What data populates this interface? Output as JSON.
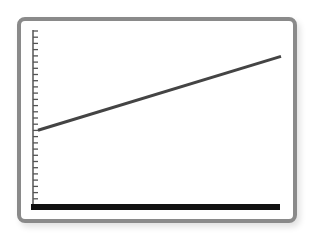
{
  "chart_data": {
    "type": "line",
    "title": "",
    "xlabel": "",
    "ylabel": "",
    "grid": false,
    "legend": null,
    "y_tick_count": 29,
    "series": [
      {
        "name": "line",
        "x": [
          0,
          1
        ],
        "values": [
          0.43,
          0.85
        ],
        "color": "#444444"
      }
    ],
    "xlim": [
      0,
      1
    ],
    "ylim": [
      0,
      1
    ]
  },
  "colors": {
    "frame_border": "#8a8a8a",
    "axis": "#111111",
    "tick": "#555555",
    "line": "#444444",
    "background": "#ffffff"
  }
}
